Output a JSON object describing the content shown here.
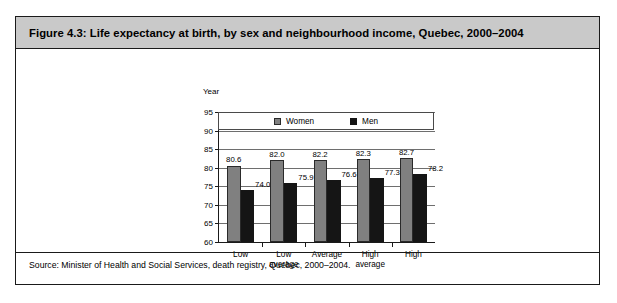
{
  "figure": {
    "title": "Figure 4.3: Life expectancy at birth, by sex and neighbourhood income, Quebec, 2000–2004",
    "source": "Source: Minister of Health and Social Services, death registry, Quebec, 2000–2004."
  },
  "colors": {
    "women": "#808080",
    "men": "#151515",
    "title_bar": "#c9c9c9",
    "frame": "#1a1a1a",
    "gridline": "#6e6e6e"
  },
  "chart_data": {
    "type": "bar",
    "title": "Figure 4.3: Life expectancy at birth, by sex and neighbourhood income, Quebec, 2000–2004",
    "xlabel": "",
    "ylabel": "Year",
    "ylim": [
      60,
      95
    ],
    "yticks": [
      60,
      65,
      70,
      75,
      80,
      85,
      90,
      95
    ],
    "ytick_labels": [
      "60",
      "65",
      "70",
      "75",
      "80",
      "85",
      "90",
      "95"
    ],
    "grid": true,
    "legend_position": "top-inside",
    "categories": [
      "Low",
      "Low average",
      "Average",
      "High average",
      "High"
    ],
    "category_labels": [
      "Low",
      "Low\naverage",
      "Average",
      "High\naverage",
      "High"
    ],
    "series": [
      {
        "name": "Women",
        "color": "#808080",
        "values": [
          80.6,
          82.0,
          82.2,
          82.3,
          82.7
        ],
        "value_labels": [
          "80.6",
          "82.0",
          "82.2",
          "82.3",
          "82.7"
        ]
      },
      {
        "name": "Men",
        "color": "#151515",
        "values": [
          74.0,
          75.9,
          76.6,
          77.3,
          78.2
        ],
        "value_labels": [
          "74.0",
          "75.9",
          "76.6",
          "77.3",
          "78.2"
        ]
      }
    ]
  }
}
